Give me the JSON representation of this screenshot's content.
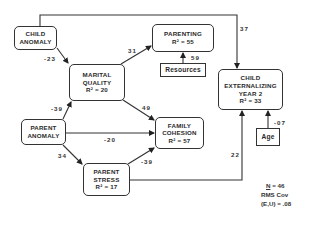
{
  "diagram": {
    "type": "path-model",
    "nodes": [
      {
        "id": "child_anomaly",
        "lines": [
          "CHILD",
          "ANOMALY"
        ]
      },
      {
        "id": "marital_quality",
        "lines": [
          "MARITAL",
          "QUALITY",
          "R² = 20"
        ]
      },
      {
        "id": "parenting",
        "lines": [
          "PARENTING",
          "R² = 55"
        ]
      },
      {
        "id": "resources",
        "lines": [
          "Resources"
        ]
      },
      {
        "id": "child_externalizing",
        "lines": [
          "CHILD",
          "EXTERNALIZING",
          "YEAR 2",
          "R² = 33"
        ]
      },
      {
        "id": "age",
        "lines": [
          "Age"
        ]
      },
      {
        "id": "parent_anomaly",
        "lines": [
          "PARENT",
          "ANOMALY"
        ]
      },
      {
        "id": "family_cohesion",
        "lines": [
          "FAMILY",
          "COHESION",
          "R² = 57"
        ]
      },
      {
        "id": "parent_stress",
        "lines": [
          "PARENT",
          "STRESS",
          "R² = 17"
        ]
      }
    ],
    "edges": [
      {
        "from": "child_anomaly",
        "to": "marital_quality",
        "coef": "-23"
      },
      {
        "from": "child_anomaly",
        "to": "child_externalizing",
        "coef": "37"
      },
      {
        "from": "marital_quality",
        "to": "parenting",
        "coef": "31"
      },
      {
        "from": "resources",
        "to": "parenting",
        "coef": "59"
      },
      {
        "from": "marital_quality",
        "to": "family_cohesion",
        "coef": "49"
      },
      {
        "from": "parent_anomaly",
        "to": "marital_quality",
        "coef": "-39"
      },
      {
        "from": "parent_anomaly",
        "to": "family_cohesion",
        "coef": "-20"
      },
      {
        "from": "parent_anomaly",
        "to": "parent_stress",
        "coef": "34"
      },
      {
        "from": "parent_stress",
        "to": "family_cohesion",
        "coef": "-39"
      },
      {
        "from": "parent_stress",
        "to": "child_externalizing",
        "coef": "22"
      },
      {
        "from": "age",
        "to": "child_externalizing",
        "coef": "-07"
      }
    ],
    "stats": {
      "n_label": "N",
      "n_value": "= 46",
      "rms_label": "RMS Cov",
      "eu_label": "(E,U)",
      "eu_value": "= .08"
    }
  }
}
